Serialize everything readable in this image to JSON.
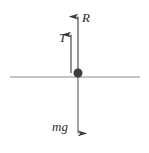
{
  "figure": {
    "type": "free-body-diagram",
    "title": "",
    "background_color": "#ffffff",
    "surface_line": {
      "name": "horizontal-reference-line",
      "color": "#8a8a8a",
      "x_start": 10,
      "x_end": 140,
      "y": 77
    },
    "particle": {
      "name": "point-mass",
      "color": "#3d3d3d",
      "cx": 78,
      "cy": 73,
      "r": 4.5
    },
    "vectors": [
      {
        "id": "R",
        "label": "R",
        "name": "normal-reaction-force-vector",
        "direction": "up",
        "color": "#4a4a4a",
        "x": 78,
        "y_tail": 73,
        "y_head": 7,
        "label_x": 82,
        "label_y": 22
      },
      {
        "id": "T",
        "label": "T",
        "name": "tension-force-vector",
        "direction": "up",
        "color": "#4a4a4a",
        "x": 71,
        "y_tail": 73,
        "y_head": 25,
        "label_x": 59,
        "label_y": 42
      },
      {
        "id": "mg",
        "label": "mg",
        "name": "weight-force-vector",
        "direction": "down",
        "color": "#6b6b6b",
        "x": 78,
        "y_tail": 77,
        "y_head": 143,
        "label_x": 52,
        "label_y": 131
      }
    ]
  }
}
